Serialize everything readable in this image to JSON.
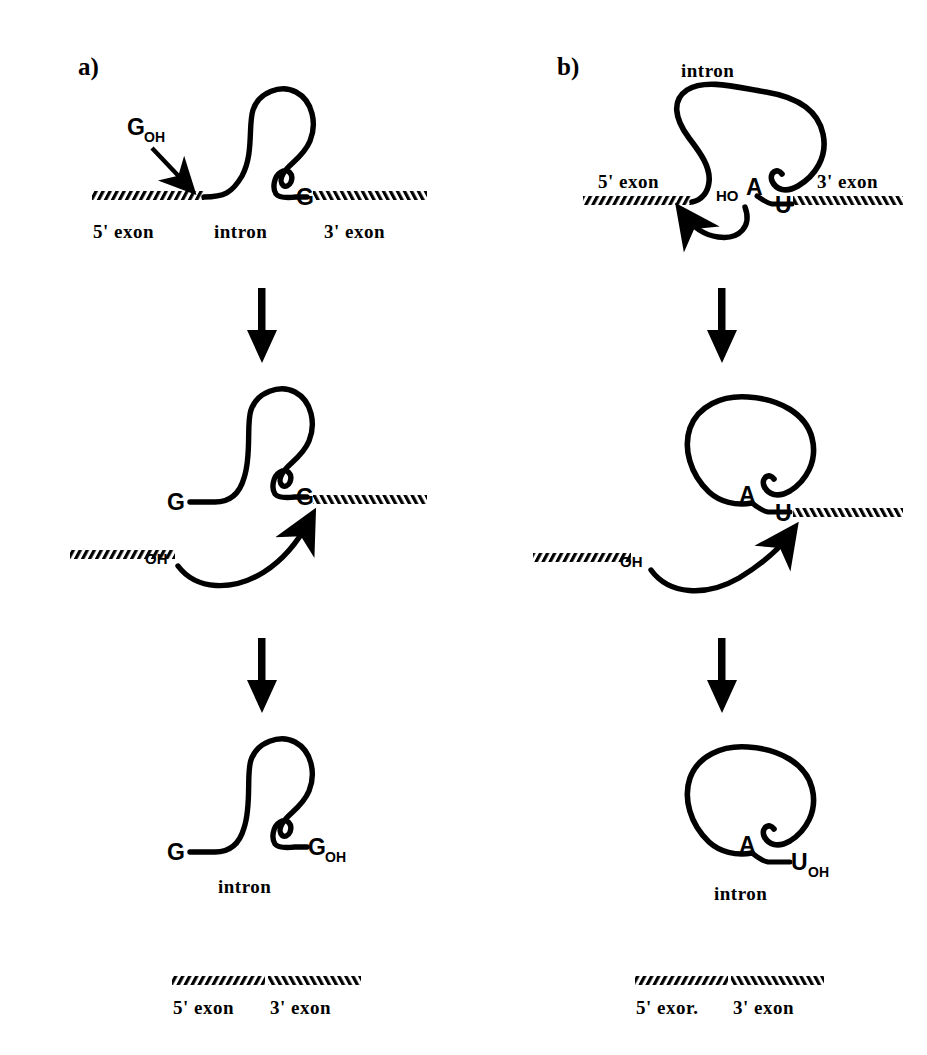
{
  "figure": {
    "background": "#ffffff",
    "ink": "#000000",
    "panels": [
      {
        "id": "a",
        "letter": "a)",
        "mechanism_name": "group-I-intron-splicing",
        "stages": [
          {
            "id": "a1",
            "name": "precursor-with-exogenous-guanosine",
            "labels": {
              "cofactor": "G",
              "cofactor_sub": "OH",
              "five_prime_exon": "5' exon",
              "intron": "intron",
              "three_prime_exon": "3' exon",
              "three_prime_intron_end": "G"
            }
          },
          {
            "id": "a2",
            "name": "free-5-prime-exon-attacks-3-splice-site",
            "labels": {
              "intron_five_end": "G",
              "intron_three_end": "G",
              "exon_hydroxyl": "OH"
            }
          },
          {
            "id": "a3",
            "name": "released-linear-intron",
            "labels": {
              "intron_five_end": "G",
              "intron_three_end": "G",
              "intron_three_end_sub": "OH",
              "intron": "intron"
            }
          },
          {
            "id": "a4",
            "name": "ligated-exons",
            "labels": {
              "five_prime_exon": "5' exon",
              "three_prime_exon": "3' exon"
            }
          }
        ]
      },
      {
        "id": "b",
        "letter": "b)",
        "mechanism_name": "group-II-intron-lariat-splicing",
        "stages": [
          {
            "id": "b1",
            "name": "precursor-with-branch-point-adenosine",
            "labels": {
              "intron": "intron",
              "five_prime_exon": "5' exon",
              "three_prime_exon": "3' exon",
              "branch_hydroxyl": "HO",
              "branch_point": "A",
              "three_prime_intron_end": "U"
            }
          },
          {
            "id": "b2",
            "name": "lariat-intermediate-exon-attacks-3-splice-site",
            "labels": {
              "branch_point": "A",
              "three_prime_intron_end": "U",
              "exon_hydroxyl": "OH"
            }
          },
          {
            "id": "b3",
            "name": "released-lariat-intron",
            "labels": {
              "branch_point": "A",
              "intron_three_end": "U",
              "intron_three_end_sub": "OH",
              "intron": "intron"
            }
          },
          {
            "id": "b4",
            "name": "ligated-exons",
            "labels": {
              "five_prime_exon": "5' exor.",
              "three_prime_exon": "3' exon"
            }
          }
        ]
      }
    ],
    "step_arrows": {
      "name": "downward-step-arrow",
      "count": 4,
      "direction": "down"
    }
  }
}
